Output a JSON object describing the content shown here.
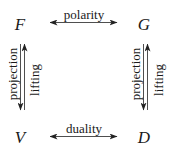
{
  "diagram": {
    "nodes": {
      "top_left": "F",
      "top_right": "G",
      "bottom_left": "V",
      "bottom_right": "D"
    },
    "edges": {
      "top": {
        "label": "polarity",
        "from": "F",
        "to": "G",
        "direction": "bidirectional"
      },
      "bottom": {
        "label": "duality",
        "from": "V",
        "to": "D",
        "direction": "bidirectional"
      },
      "left_down": {
        "label": "projection",
        "from": "F",
        "to": "V",
        "direction": "down"
      },
      "left_up": {
        "label": "lifting",
        "from": "V",
        "to": "F",
        "direction": "up"
      },
      "right_down": {
        "label": "projection",
        "from": "G",
        "to": "D",
        "direction": "down"
      },
      "right_up": {
        "label": "lifting",
        "from": "D",
        "to": "G",
        "direction": "up"
      }
    },
    "colors": {
      "stroke": "#222222",
      "text": "#1a1a1a",
      "background": "#ffffff"
    }
  }
}
